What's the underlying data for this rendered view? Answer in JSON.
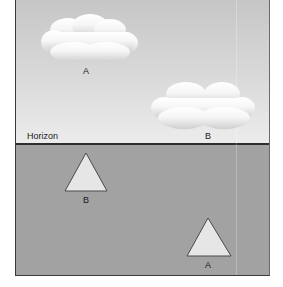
{
  "diagram": {
    "horizon_label": "Horizon",
    "clouds": [
      {
        "id": "A",
        "label": "A"
      },
      {
        "id": "B",
        "label": "B"
      }
    ],
    "triangles": [
      {
        "id": "B",
        "label": "B"
      },
      {
        "id": "A",
        "label": "A"
      }
    ],
    "colors": {
      "sky_top": "#c6c6c6",
      "sky_bottom": "#ececec",
      "ground": "#a2a2a2",
      "horizon_line": "#2e2e2e",
      "triangle_fill": "#e6e6e6",
      "triangle_stroke": "#4a4a4a"
    }
  }
}
